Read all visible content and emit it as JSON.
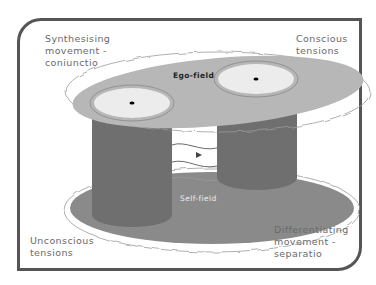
{
  "labels": {
    "top_left": "Synthesising\nmovement -\nconiunctio",
    "top_right": "Conscious\ntensions",
    "bottom_left": "Unconscious\ntensions",
    "bottom_right": "Differentiating\nmovement -\nseparatio",
    "ego_field": "Ego-field",
    "self_field": "Self-field"
  },
  "colors": {
    "frame": "#555555",
    "ego_plate": "#b7b7b7",
    "self_plate": "#8a8a8a",
    "cylinder": "#6f6f6f",
    "cylinder_top": "#ececec",
    "label_text": "#6a6a6a"
  }
}
